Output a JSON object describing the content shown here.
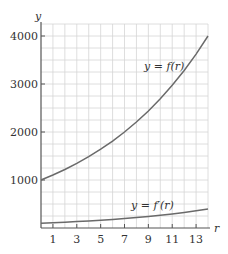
{
  "chart_data": {
    "type": "line",
    "title": "",
    "xlabel": "r",
    "ylabel": "y",
    "xlim": [
      0,
      14
    ],
    "ylim": [
      0,
      4250
    ],
    "grid": true,
    "x_ticks": [
      1,
      3,
      5,
      7,
      9,
      11,
      13
    ],
    "y_ticks": [
      1000,
      2000,
      3000,
      4000
    ],
    "x": [
      0,
      1,
      2,
      3,
      4,
      5,
      6,
      7,
      8,
      9,
      10,
      11,
      12,
      13,
      14
    ],
    "series": [
      {
        "name": "y = f(r)",
        "values": [
          1000,
          1104,
          1219,
          1346,
          1486,
          1641,
          1811,
          2000,
          2208,
          2438,
          2692,
          2972,
          3281,
          3623,
          4000
        ]
      },
      {
        "name": "y = f'(r)",
        "values": [
          99,
          109,
          121,
          133,
          147,
          162,
          179,
          198,
          219,
          241,
          267,
          294,
          325,
          359,
          396
        ]
      }
    ],
    "annotations": [
      {
        "text": "y = f(r)",
        "x": 10.5,
        "y": 3600
      },
      {
        "text": "y = f'(r)",
        "x": 9.5,
        "y": 450
      }
    ]
  },
  "labels": {
    "y_axis": "y",
    "x_axis": "r",
    "f_label": "y = f(r)",
    "fprime_label": "y = f′(r)",
    "x_tick_labels": [
      "1",
      "3",
      "5",
      "7",
      "9",
      "11",
      "13"
    ],
    "y_tick_labels": [
      "1000",
      "2000",
      "3000",
      "4000"
    ]
  }
}
